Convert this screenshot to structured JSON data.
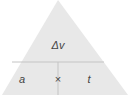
{
  "diagram": {
    "type": "formula-triangle",
    "top": "Δv",
    "bottom_left": "a",
    "operator": "×",
    "bottom_right": "t",
    "colors": {
      "fill": "#e8e8e8",
      "line": "#c4c4c4",
      "text": "#444444"
    }
  }
}
